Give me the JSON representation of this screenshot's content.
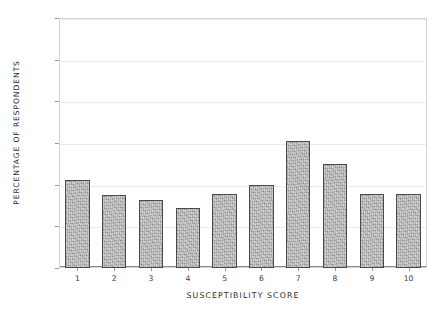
{
  "chart_data": {
    "type": "bar",
    "title": "",
    "xlabel": "SUSCEPTIBILITY SCORE",
    "ylabel": "PERCENTAGE OF RESPONDENTS",
    "categories": [
      "1",
      "2",
      "3",
      "4",
      "5",
      "6",
      "7",
      "8",
      "9",
      "10"
    ],
    "values": [
      10.6,
      8.8,
      8.2,
      7.2,
      8.9,
      10.0,
      15.3,
      12.5,
      8.9,
      8.9
    ],
    "ylim": [
      0,
      30
    ],
    "yticks": [
      0,
      5,
      10,
      15,
      20,
      25,
      30
    ],
    "ytick_labels": [
      "0%",
      "5%",
      "10%",
      "15%",
      "20%",
      "25%",
      "30%"
    ],
    "grid": true,
    "legend": false,
    "bar_color": "#a9a9a9",
    "bar_edge_color": "#4a4a4a",
    "grid_color": "#ececec",
    "frame_color": "#d2d2d2",
    "text_color": "#2b2b2b"
  },
  "axes": {
    "y_title": "PERCENTAGE OF RESPONDENTS",
    "x_title": "SUSCEPTIBILITY SCORE"
  }
}
